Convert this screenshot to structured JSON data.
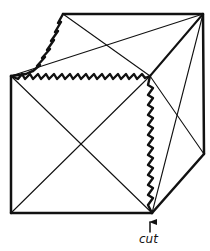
{
  "diagram": {
    "type": "cube-net-cut",
    "stroke_color": "#111111",
    "background": "#ffffff",
    "vertices": {
      "top_back_left": [
        63,
        14
      ],
      "top_back_right": [
        203,
        14
      ],
      "front_top_left": [
        11,
        76
      ],
      "front_top_right": [
        150,
        76
      ],
      "front_bottom_left": [
        11,
        213
      ],
      "front_bottom_right": [
        152,
        213
      ],
      "back_bottom_right": [
        204,
        154
      ]
    },
    "cut_edges": [
      "top_back_left-front_top_left",
      "front_top_left-front_top_right",
      "front_top_right-front_bottom_right"
    ],
    "label": {
      "text": "cut",
      "x": 140,
      "y": 232
    }
  }
}
